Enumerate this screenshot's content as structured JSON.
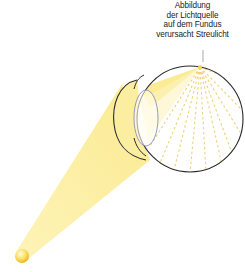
{
  "annotation": {
    "lines": [
      "Abbildung",
      "der Lichtquelle",
      "auf dem Fundus",
      "verursacht Streulicht"
    ]
  },
  "colors": {
    "beam": "#fbe98a",
    "beam_edge": "#f3d75a",
    "scatter": "#f0d27a",
    "outline": "#2a2a2a",
    "lens": "#8a8fb8",
    "source": "#f7d23e"
  },
  "elements": {
    "light_source": "light-source",
    "eye": "eyeball",
    "lens": "lens",
    "cornea": "cornea"
  }
}
